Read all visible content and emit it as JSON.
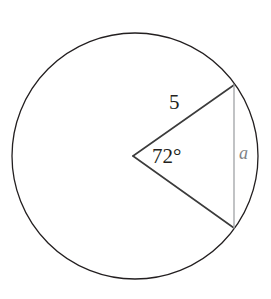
{
  "figure": {
    "background_color": "#ffffff",
    "width": 271,
    "height": 299
  },
  "circle": {
    "name": "circle-outline",
    "center_x": 135,
    "center_y": 156,
    "radius": 123,
    "stroke_color": "#231f20",
    "stroke_width": 1.3,
    "fill": "none"
  },
  "sector": {
    "vertex_x": 133,
    "vertex_y": 156,
    "upper_endpoint_x": 234,
    "upper_endpoint_y": 85,
    "lower_endpoint_x": 234,
    "lower_endpoint_y": 228,
    "stroke_color": "#3b3b3b",
    "stroke_width": 1.6
  },
  "chord": {
    "name": "vertical-chord-apothem-side",
    "x": 234,
    "y_top": 85,
    "y_bottom": 228,
    "stroke_color": "#a7a9ac",
    "stroke_width": 1.4
  },
  "labels": {
    "radius": "5",
    "angle": "72°",
    "apothem": "a"
  },
  "colors": {
    "ink": "#231f20",
    "sector_line": "#3b3b3b",
    "chord_line": "#a7a9ac",
    "apothem_label": "#808285",
    "background": "#ffffff"
  }
}
